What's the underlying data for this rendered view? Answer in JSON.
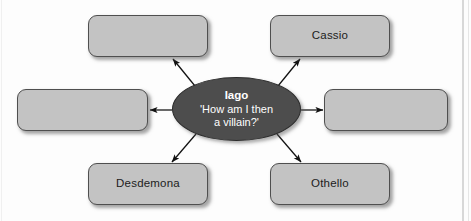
{
  "diagram": {
    "type": "spider-mind-map",
    "center": {
      "title": "Iago",
      "quote": "'How am I then\na villain?'",
      "fill_color": "#4d4d4d",
      "text_color": "#ffffff"
    },
    "node_fill_color": "#c3c3c3",
    "node_border_color": "#4f4f4f",
    "arrow_color": "#111111",
    "nodes": [
      {
        "id": "top-left",
        "label": "",
        "empty": true
      },
      {
        "id": "top-right",
        "label": "Cassio",
        "empty": false
      },
      {
        "id": "mid-left",
        "label": "",
        "empty": true
      },
      {
        "id": "mid-right",
        "label": "",
        "empty": true
      },
      {
        "id": "bottom-left",
        "label": "Desdemona",
        "empty": false
      },
      {
        "id": "bottom-right",
        "label": "Othello",
        "empty": false
      }
    ]
  }
}
